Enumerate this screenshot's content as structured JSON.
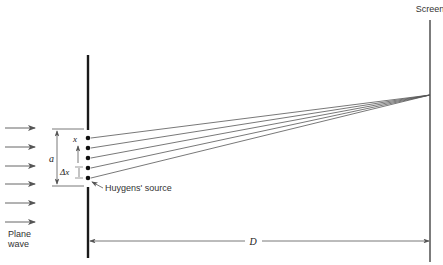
{
  "diagram": {
    "labels": {
      "screen": "Screen",
      "plane_wave_line1": "Plane",
      "plane_wave_line2": "wave",
      "slit_width": "a",
      "position": "x",
      "spacing": "Δx",
      "huygens_source": "Huygens' source",
      "distance": "D"
    },
    "plane_wave_arrows": [
      {
        "y": 128
      },
      {
        "y": 147
      },
      {
        "y": 166
      },
      {
        "y": 184
      },
      {
        "y": 203
      },
      {
        "y": 222
      }
    ],
    "sources": [
      {
        "x": 88,
        "y": 138
      },
      {
        "x": 88,
        "y": 148
      },
      {
        "x": 88,
        "y": 158
      },
      {
        "x": 88,
        "y": 168
      },
      {
        "x": 88,
        "y": 178
      }
    ],
    "convergence_point": {
      "x": 430,
      "y": 95
    },
    "colors": {
      "barrier": "#1a1a1a",
      "rays": "#555555",
      "arrows": "#666666",
      "text": "#222222"
    }
  }
}
